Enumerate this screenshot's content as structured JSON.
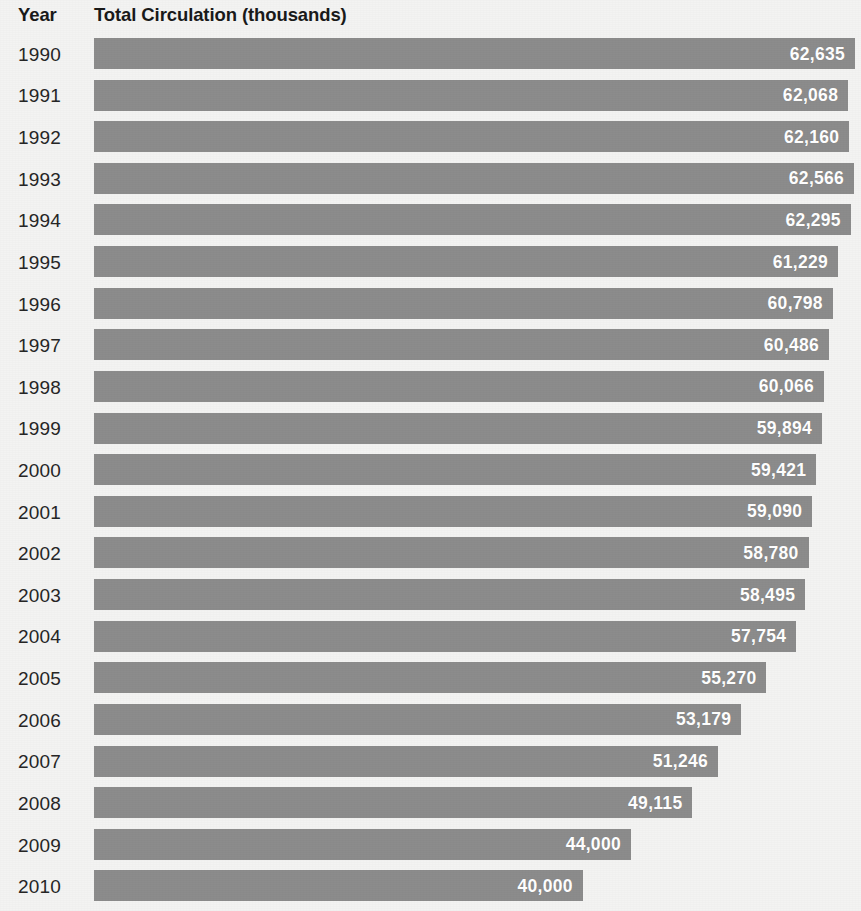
{
  "header": {
    "year_label": "Year",
    "metric_label": "Total Circulation (thousands)"
  },
  "style": {
    "bar_color": "#8c8c8c",
    "background_color": "#f3f3f2",
    "value_text_color": "#ffffff",
    "label_text_color": "#262626",
    "header_text_color": "#1a1a1a"
  },
  "chart_data": {
    "type": "bar",
    "orientation": "horizontal",
    "title": "Total Circulation (thousands)",
    "xlabel": "Total Circulation (thousands)",
    "ylabel": "Year",
    "grid": false,
    "legend": null,
    "xlim": [
      0,
      62635
    ],
    "categories": [
      "1990",
      "1991",
      "1992",
      "1993",
      "1994",
      "1995",
      "1996",
      "1997",
      "1998",
      "1999",
      "2000",
      "2001",
      "2002",
      "2003",
      "2004",
      "2005",
      "2006",
      "2007",
      "2008",
      "2009",
      "2010"
    ],
    "values": [
      62635,
      62068,
      62160,
      62566,
      62295,
      61229,
      60798,
      60486,
      60066,
      59894,
      59421,
      59090,
      58780,
      58495,
      57754,
      55270,
      53179,
      51246,
      49115,
      44000,
      40000
    ],
    "value_labels": [
      "62,635",
      "62,068",
      "62,160",
      "62,566",
      "62,295",
      "61,229",
      "60,798",
      "60,486",
      "60,066",
      "59,894",
      "59,421",
      "59,090",
      "58,780",
      "58,495",
      "57,754",
      "55,270",
      "53,179",
      "51,246",
      "49,115",
      "44,000",
      "40,000"
    ]
  },
  "rows": [
    {
      "year": "1990",
      "value": 62635,
      "value_label": "62,635"
    },
    {
      "year": "1991",
      "value": 62068,
      "value_label": "62,068"
    },
    {
      "year": "1992",
      "value": 62160,
      "value_label": "62,160"
    },
    {
      "year": "1993",
      "value": 62566,
      "value_label": "62,566"
    },
    {
      "year": "1994",
      "value": 62295,
      "value_label": "62,295"
    },
    {
      "year": "1995",
      "value": 61229,
      "value_label": "61,229"
    },
    {
      "year": "1996",
      "value": 60798,
      "value_label": "60,798"
    },
    {
      "year": "1997",
      "value": 60486,
      "value_label": "60,486"
    },
    {
      "year": "1998",
      "value": 60066,
      "value_label": "60,066"
    },
    {
      "year": "1999",
      "value": 59894,
      "value_label": "59,894"
    },
    {
      "year": "2000",
      "value": 59421,
      "value_label": "59,421"
    },
    {
      "year": "2001",
      "value": 59090,
      "value_label": "59,090"
    },
    {
      "year": "2002",
      "value": 58780,
      "value_label": "58,780"
    },
    {
      "year": "2003",
      "value": 58495,
      "value_label": "58,495"
    },
    {
      "year": "2004",
      "value": 57754,
      "value_label": "57,754"
    },
    {
      "year": "2005",
      "value": 55270,
      "value_label": "55,270"
    },
    {
      "year": "2006",
      "value": 53179,
      "value_label": "53,179"
    },
    {
      "year": "2007",
      "value": 51246,
      "value_label": "51,246"
    },
    {
      "year": "2008",
      "value": 49115,
      "value_label": "49,115"
    },
    {
      "year": "2009",
      "value": 44000,
      "value_label": "44,000"
    },
    {
      "year": "2010",
      "value": 40000,
      "value_label": "40,000"
    }
  ]
}
